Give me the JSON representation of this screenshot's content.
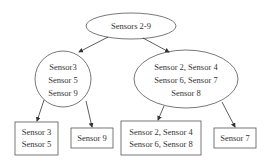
{
  "diagram": {
    "type": "tree",
    "root": {
      "label": "Sensors 2-9",
      "shape": "ellipse"
    },
    "level1": [
      {
        "lines": [
          "Sensor3",
          "Sensor 5",
          "Sensor 9"
        ],
        "shape": "circle"
      },
      {
        "lines": [
          "Sensor 2, Sensor 4",
          "Sensor 6, Sensor 7",
          "Sensor 8"
        ],
        "shape": "ellipse"
      }
    ],
    "leaves": [
      {
        "lines": [
          "Sensor 3",
          "Sensor 5"
        ],
        "parent": 0,
        "shape": "rectangle"
      },
      {
        "lines": [
          "Sensor 9"
        ],
        "parent": 0,
        "shape": "rectangle"
      },
      {
        "lines": [
          "Sensor 2, Sensor 4",
          "Sensor 6, Sensor 8"
        ],
        "parent": 1,
        "shape": "rectangle"
      },
      {
        "lines": [
          "Sensor 7"
        ],
        "parent": 1,
        "shape": "rectangle"
      }
    ],
    "colors": {
      "stroke": "#555555",
      "text": "#333333",
      "background": "#ffffff"
    }
  }
}
